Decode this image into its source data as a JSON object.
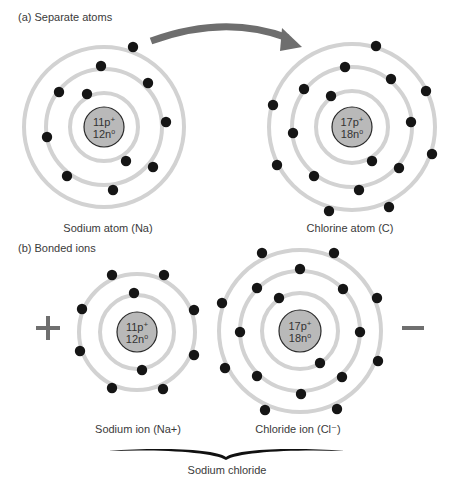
{
  "section_a": {
    "label": "(a) Separate atoms"
  },
  "section_b": {
    "label": "(b) Bonded ions"
  },
  "colors": {
    "shell": "#d2d2d2",
    "nucleus_fill": "#b9b9b9",
    "electron": "#151515",
    "arrow": "#6e6e6e",
    "sign": "#6f6f6f"
  },
  "atoms": [
    {
      "id": "sodium-atom",
      "caption": "Sodium atom (Na)",
      "protons": "11p",
      "proton_sup": "+",
      "neutrons": "12n",
      "neutron_sup": "o",
      "center": [
        104,
        127
      ],
      "nucleus_r": 20,
      "shells_r": [
        34,
        58,
        80
      ],
      "electrons": [
        [
          133,
          47
        ],
        [
          101,
          66
        ],
        [
          148,
          83
        ],
        [
          59,
          92
        ],
        [
          87,
          94
        ],
        [
          166,
          122
        ],
        [
          47,
          137
        ],
        [
          126,
          161
        ],
        [
          153,
          167
        ],
        [
          67,
          176
        ],
        [
          113,
          190
        ]
      ]
    },
    {
      "id": "chlorine-atom",
      "caption": "Chlorine atom (C)",
      "protons": "17p",
      "proton_sup": "+",
      "neutrons": "18n",
      "neutron_sup": "o",
      "center": [
        352,
        127
      ],
      "nucleus_r": 20,
      "shells_r": [
        36,
        60,
        83
      ],
      "electrons": [
        [
          376,
          46
        ],
        [
          345,
          67
        ],
        [
          391,
          79
        ],
        [
          304,
          89
        ],
        [
          426,
          91
        ],
        [
          331,
          96
        ],
        [
          273,
          105
        ],
        [
          411,
          122
        ],
        [
          293,
          133
        ],
        [
          432,
          154
        ],
        [
          372,
          161
        ],
        [
          277,
          165
        ],
        [
          399,
          168
        ],
        [
          314,
          176
        ],
        [
          359,
          190
        ],
        [
          329,
          211
        ],
        [
          389,
          207
        ]
      ]
    }
  ],
  "ions": [
    {
      "id": "sodium-ion",
      "caption": "Sodium ion (Na+)",
      "protons": "11p",
      "proton_sup": "+",
      "neutrons": "12n",
      "neutron_sup": "o",
      "center": [
        137,
        332
      ],
      "nucleus_r": 20,
      "shells_r": [
        37,
        58
      ],
      "electrons": [
        [
          112,
          275
        ],
        [
          164,
          275
        ],
        [
          134,
          293
        ],
        [
          82,
          309
        ],
        [
          194,
          310
        ],
        [
          80,
          351
        ],
        [
          194,
          355
        ],
        [
          142,
          370
        ],
        [
          112,
          388
        ],
        [
          163,
          389
        ]
      ]
    },
    {
      "id": "chloride-ion",
      "caption": "Chloride ion (Cl⁻)",
      "protons": "17p",
      "proton_sup": "+",
      "neutrons": "18n",
      "neutron_sup": "o",
      "center": [
        300,
        331
      ],
      "nucleus_r": 21,
      "shells_r": [
        38,
        60,
        81
      ],
      "electrons": [
        [
          262,
          253
        ],
        [
          334,
          253
        ],
        [
          300,
          269
        ],
        [
          257,
          288
        ],
        [
          343,
          289
        ],
        [
          279,
          298
        ],
        [
          222,
          303
        ],
        [
          377,
          298
        ],
        [
          240,
          332
        ],
        [
          360,
          332
        ],
        [
          225,
          368
        ],
        [
          378,
          361
        ],
        [
          320,
          363
        ],
        [
          257,
          376
        ],
        [
          342,
          377
        ],
        [
          301,
          394
        ],
        [
          265,
          410
        ],
        [
          337,
          409
        ]
      ]
    }
  ],
  "charges": {
    "positive": "+",
    "negative": "−"
  },
  "compound": {
    "label": "Sodium chloride"
  },
  "transfer_arrow": {
    "icon": "curved-arrow-icon",
    "meaning": "electron transfer from Na to Cl"
  }
}
